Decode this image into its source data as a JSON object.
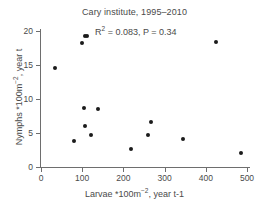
{
  "chart_data": {
    "type": "scatter",
    "title": "Cary institute, 1995–2010",
    "xlabel": "Larvae *100m⁻², year t-1",
    "ylabel": "Nymphs *100m⁻², year t",
    "xlabel_parts": {
      "pre": "Larvae *100m",
      "sup": "−2",
      "post": ", year t-1"
    },
    "ylabel_parts": {
      "pre": "Nymphs *100m",
      "sup": "−2",
      "post": ", year t"
    },
    "annotation": "R² = 0.083, P = 0.34",
    "annotation_parts": {
      "pre": "R",
      "sup": "2",
      "post": " = 0.083, P = 0.34"
    },
    "r_squared": 0.083,
    "p_value": 0.34,
    "xlim": [
      0,
      500
    ],
    "ylim": [
      0,
      20
    ],
    "xticks": [
      0,
      100,
      200,
      300,
      400,
      500
    ],
    "yticks": [
      0,
      5,
      10,
      15,
      20
    ],
    "grid": false,
    "legend": "none",
    "marker": "filled-circle",
    "marker_color": "#1b1b1b",
    "axis_color": "#6e6e6e",
    "points": [
      {
        "x": 35,
        "y": 14.5
      },
      {
        "x": 79,
        "y": 3.85
      },
      {
        "x": 99,
        "y": 18.2
      },
      {
        "x": 106,
        "y": 19.2
      },
      {
        "x": 112,
        "y": 19.2
      },
      {
        "x": 104,
        "y": 8.65
      },
      {
        "x": 108,
        "y": 6.1
      },
      {
        "x": 122,
        "y": 4.7
      },
      {
        "x": 138,
        "y": 8.5
      },
      {
        "x": 219,
        "y": 2.6
      },
      {
        "x": 259,
        "y": 4.7
      },
      {
        "x": 266,
        "y": 6.65
      },
      {
        "x": 345,
        "y": 4.1
      },
      {
        "x": 425,
        "y": 18.4
      },
      {
        "x": 485,
        "y": 2.0
      }
    ]
  }
}
